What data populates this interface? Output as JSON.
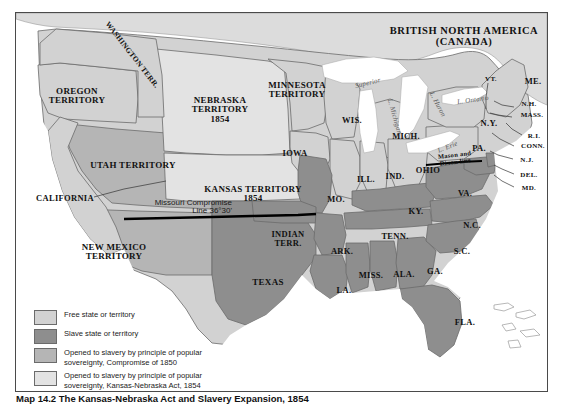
{
  "map": {
    "title_canada": "BRITISH NORTH AMERICA\n(CANADA)",
    "colors": {
      "free": "#d2d2d2",
      "slave": "#8e8e8e",
      "popsov_1850": "#b5b5b5",
      "popsov_1854": "#e3e3e3",
      "water": "#ffffff",
      "canada": "#dcdcdc",
      "border": "#4a4a4a",
      "outline": "#6b6b6b",
      "compromise_line": "#000000"
    },
    "territories": [
      {
        "name": "oregon-territory",
        "label": "OREGON\nTERRITORY",
        "x": 28,
        "y": 74,
        "w": 66,
        "class": "terr",
        "rot": 0
      },
      {
        "name": "washington-territory",
        "label": "WASHINGTON TERR.",
        "x": 68,
        "y": 38,
        "w": 96,
        "class": "small",
        "rot": 52
      },
      {
        "name": "utah-territory",
        "label": "UTAH TERRITORY",
        "x": 62,
        "y": 148,
        "w": 110,
        "class": "terr",
        "rot": 0
      },
      {
        "name": "new-mexico-territory",
        "label": "NEW MEXICO\nTERRITORY",
        "x": 52,
        "y": 230,
        "w": 92,
        "class": "terr",
        "rot": 0
      },
      {
        "name": "nebraska-territory",
        "label": "NEBRASKA\nTERRITORY\n1854",
        "x": 163,
        "y": 83,
        "w": 82,
        "class": "terr",
        "rot": 0
      },
      {
        "name": "minnesota-territory",
        "label": "MINNESOTA\nTERRITORY",
        "x": 243,
        "y": 68,
        "w": 76,
        "class": "terr",
        "rot": 0
      },
      {
        "name": "kansas-territory",
        "label": "KANSAS TERRITORY\n1854",
        "x": 185,
        "y": 172,
        "w": 104,
        "class": "terr",
        "rot": 0
      },
      {
        "name": "indian-territory",
        "label": "INDIAN\nTERR.",
        "x": 247,
        "y": 217,
        "w": 50,
        "class": "state",
        "rot": 0
      }
    ],
    "states": [
      {
        "name": "california",
        "label": "CALIFORNIA",
        "x": 18,
        "y": 181,
        "w": 62,
        "class": "state"
      },
      {
        "name": "texas",
        "label": "TEXAS",
        "x": 228,
        "y": 265,
        "w": 48,
        "class": "terr"
      },
      {
        "name": "iowa",
        "label": "IOWA",
        "x": 262,
        "y": 136,
        "w": 34,
        "class": "state"
      },
      {
        "name": "missouri",
        "label": "MO.",
        "x": 307,
        "y": 182,
        "w": 26,
        "class": "state"
      },
      {
        "name": "wisconsin",
        "label": "WIS.",
        "x": 323,
        "y": 103,
        "w": 26,
        "class": "state"
      },
      {
        "name": "michigan",
        "label": "MICH.",
        "x": 374,
        "y": 119,
        "w": 32,
        "class": "state"
      },
      {
        "name": "illinois",
        "label": "ILL.",
        "x": 339,
        "y": 162,
        "w": 22,
        "class": "state"
      },
      {
        "name": "indiana",
        "label": "IND.",
        "x": 367,
        "y": 159,
        "w": 24,
        "class": "state"
      },
      {
        "name": "ohio",
        "label": "OHIO",
        "x": 397,
        "y": 153,
        "w": 30,
        "class": "state"
      },
      {
        "name": "kentucky",
        "label": "KY.",
        "x": 389,
        "y": 194,
        "w": 22,
        "class": "state"
      },
      {
        "name": "tennessee",
        "label": "TENN.",
        "x": 363,
        "y": 219,
        "w": 32,
        "class": "state"
      },
      {
        "name": "arkansas",
        "label": "ARK.",
        "x": 312,
        "y": 234,
        "w": 28,
        "class": "state"
      },
      {
        "name": "mississippi",
        "label": "MISS.",
        "x": 340,
        "y": 258,
        "w": 30,
        "class": "state"
      },
      {
        "name": "alabama",
        "label": "ALA.",
        "x": 375,
        "y": 257,
        "w": 26,
        "class": "state"
      },
      {
        "name": "georgia",
        "label": "GA.",
        "x": 407,
        "y": 254,
        "w": 24,
        "class": "state"
      },
      {
        "name": "louisiana",
        "label": "LA.",
        "x": 317,
        "y": 273,
        "w": 22,
        "class": "state"
      },
      {
        "name": "florida",
        "label": "FLA.",
        "x": 436,
        "y": 305,
        "w": 26,
        "class": "state"
      },
      {
        "name": "south-carolina",
        "label": "S.C.",
        "x": 434,
        "y": 234,
        "w": 24,
        "class": "state"
      },
      {
        "name": "north-carolina",
        "label": "N.C.",
        "x": 443,
        "y": 208,
        "w": 26,
        "class": "state"
      },
      {
        "name": "virginia",
        "label": "VA.",
        "x": 437,
        "y": 176,
        "w": 24,
        "class": "state"
      },
      {
        "name": "pennsylvania",
        "label": "PA.",
        "x": 451,
        "y": 131,
        "w": 24,
        "class": "state"
      },
      {
        "name": "new-york",
        "label": "N.Y.",
        "x": 460,
        "y": 106,
        "w": 26,
        "class": "state"
      },
      {
        "name": "maine",
        "label": "ME.",
        "x": 505,
        "y": 64,
        "w": 24,
        "class": "state"
      },
      {
        "name": "vermont",
        "label": "VT.",
        "x": 465,
        "y": 63,
        "w": 20,
        "class": "tiny"
      },
      {
        "name": "new-hampshire",
        "label": "N.H.",
        "x": 501,
        "y": 88,
        "w": 24,
        "class": "tiny"
      },
      {
        "name": "massachusetts",
        "label": "MASS.",
        "x": 500,
        "y": 99,
        "w": 32,
        "class": "tiny"
      },
      {
        "name": "rhode-island",
        "label": "R.I.",
        "x": 508,
        "y": 120,
        "w": 20,
        "class": "tiny"
      },
      {
        "name": "connecticut",
        "label": "CONN.",
        "x": 501,
        "y": 130,
        "w": 32,
        "class": "tiny"
      },
      {
        "name": "new-jersey",
        "label": "N.J.",
        "x": 500,
        "y": 144,
        "w": 22,
        "class": "tiny"
      },
      {
        "name": "delaware",
        "label": "DEL.",
        "x": 501,
        "y": 159,
        "w": 24,
        "class": "tiny"
      },
      {
        "name": "maryland",
        "label": "MD.",
        "x": 501,
        "y": 172,
        "w": 24,
        "class": "tiny"
      }
    ],
    "lakes": [
      {
        "name": "lake-superior",
        "label": "Superior",
        "x": 329,
        "y": 67,
        "rot": -14
      },
      {
        "name": "lake-michigan",
        "label": "L. Michigan",
        "x": 352,
        "y": 100,
        "rot": 74
      },
      {
        "name": "lake-huron",
        "label": "L. Huron",
        "x": 399,
        "y": 88,
        "rot": 62
      },
      {
        "name": "lake-erie",
        "label": "L. Erie",
        "x": 413,
        "y": 131,
        "rot": -22
      },
      {
        "name": "lake-ontario",
        "label": "L. Ontario",
        "x": 433,
        "y": 84,
        "rot": -8
      }
    ],
    "annotations": {
      "missouri_compromise": "Missouri Compromise\nLine 36°30'",
      "mason_dixon": "Mason and\nDixon line"
    }
  },
  "legend": {
    "items": [
      {
        "key": "free",
        "swatch": "#d2d2d2",
        "text": "Free state or territory"
      },
      {
        "key": "slave",
        "swatch": "#8e8e8e",
        "text": "Slave state or territory"
      },
      {
        "key": "popsov_1850",
        "swatch": "#b5b5b5",
        "text": "Opened to slavery by principle of popular\nsovereignty, Compromise of 1850"
      },
      {
        "key": "popsov_1854",
        "swatch": "#e3e3e3",
        "text": "Opened to slavery by principle of popular\nsovereignty, Kansas-Nebraska Act, 1854"
      }
    ]
  },
  "caption": {
    "number": "Map 14.2",
    "text": "The Kansas-Nebraska Act and Slavery Expansion, 1854"
  }
}
